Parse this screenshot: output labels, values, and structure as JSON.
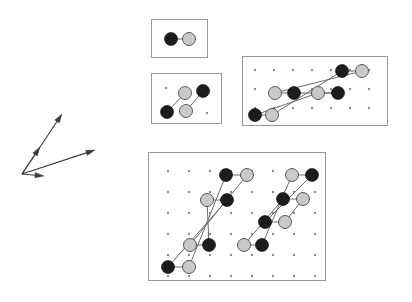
{
  "figure": {
    "background_color": "#ffffff",
    "width": 412,
    "height": 302
  },
  "colors": {
    "site_dark": "#1c1c1c",
    "site_light": "#c9c9c9",
    "site_light_stroke": "#4a4a4a",
    "bond": "#6a6a6a",
    "lattice_dot": "#8d8d8d",
    "panel_border": "#9a9a9a",
    "vector": "#3a3a3a"
  },
  "basis_vectors": {
    "name": "basis-vector-set",
    "origin": [
      22,
      174
    ],
    "vectors": [
      {
        "name": "vector-long-up",
        "label": "",
        "tip": [
          62,
          114
        ],
        "length_px": 72,
        "angle_deg": 56
      },
      {
        "name": "vector-short-up",
        "label": "",
        "tip": [
          40,
          147
        ],
        "length_px": 32,
        "angle_deg": 56
      },
      {
        "name": "vector-long-right",
        "label": "",
        "tip": [
          95,
          150
        ],
        "length_px": 76,
        "angle_deg": 18
      },
      {
        "name": "vector-short-left",
        "label": "",
        "tip": [
          44,
          176
        ],
        "length_px": 22,
        "angle_deg": -5
      }
    ]
  },
  "panels": [
    {
      "name": "panel-single-dimer",
      "index": 1,
      "rect": [
        151,
        19,
        56,
        38
      ],
      "lattice": {
        "dots": [],
        "spacing": 0
      },
      "dimers": [
        {
          "name": "dimer",
          "dark": [
            171,
            39
          ],
          "light": [
            189,
            39
          ]
        }
      ]
    },
    {
      "name": "panel-two-dimers",
      "index": 2,
      "rect": [
        151,
        73,
        70,
        50
      ],
      "lattice": {
        "spacing": 0,
        "dots": [
          [
            166,
            88
          ],
          [
            207,
            113
          ]
        ]
      },
      "dimers": [
        {
          "name": "dimer",
          "dark": [
            167,
            112
          ],
          "light": [
            185,
            93
          ]
        },
        {
          "name": "dimer",
          "dark": [
            203,
            91
          ],
          "light": [
            186,
            111
          ]
        }
      ]
    },
    {
      "name": "panel-medium-lattice",
      "index": 3,
      "rect": [
        242,
        56,
        145,
        69
      ],
      "lattice": {
        "spacing": 19,
        "cols": 7,
        "rows": 3,
        "origin": [
          255,
          70
        ]
      },
      "dimers": [
        {
          "name": "dimer",
          "dark": [
            255,
            115
          ],
          "light": [
            272,
            115
          ]
        },
        {
          "name": "dimer",
          "dark": [
            294,
            93
          ],
          "light": [
            275,
            93
          ]
        },
        {
          "name": "dimer",
          "dark": [
            342,
            71
          ],
          "light": [
            362,
            71
          ]
        },
        {
          "name": "dimer",
          "dark": [
            338,
            93
          ],
          "light": [
            318,
            93
          ]
        }
      ],
      "bonds": [
        {
          "name": "bond-long",
          "from": [
            272,
            115
          ],
          "to": [
            342,
            71
          ]
        },
        {
          "name": "bond-long",
          "from": [
            275,
            93
          ],
          "to": [
            362,
            71
          ]
        },
        {
          "name": "bond-long",
          "from": [
            255,
            115
          ],
          "to": [
            318,
            93
          ]
        },
        {
          "name": "bond-long",
          "from": [
            294,
            93
          ],
          "to": [
            338,
            93
          ]
        }
      ]
    },
    {
      "name": "panel-large-lattice",
      "index": 4,
      "rect": [
        148,
        152,
        177,
        128
      ],
      "lattice": {
        "spacing": 21,
        "cols": 8,
        "rows": 6,
        "origin": [
          168,
          171
        ]
      },
      "dimers": [
        {
          "name": "dimer",
          "dark": [
            168,
            267
          ],
          "light": [
            189,
            267
          ]
        },
        {
          "name": "dimer",
          "dark": [
            209,
            245
          ],
          "light": [
            190,
            245
          ]
        },
        {
          "name": "dimer",
          "dark": [
            227,
            200
          ],
          "light": [
            207,
            200
          ]
        },
        {
          "name": "dimer",
          "dark": [
            226,
            175
          ],
          "light": [
            247,
            175
          ]
        },
        {
          "name": "dimer",
          "dark": [
            262,
            245
          ],
          "light": [
            244,
            245
          ]
        },
        {
          "name": "dimer",
          "dark": [
            265,
            222
          ],
          "light": [
            285,
            222
          ]
        },
        {
          "name": "dimer",
          "dark": [
            283,
            199
          ],
          "light": [
            303,
            199
          ]
        },
        {
          "name": "dimer",
          "dark": [
            312,
            175
          ],
          "light": [
            292,
            175
          ]
        }
      ],
      "bonds": [
        {
          "name": "bond-long",
          "from": [
            168,
            267
          ],
          "to": [
            227,
            200
          ]
        },
        {
          "name": "bond-long",
          "from": [
            189,
            267
          ],
          "to": [
            226,
            175
          ]
        },
        {
          "name": "bond-long",
          "from": [
            190,
            245
          ],
          "to": [
            247,
            175
          ]
        },
        {
          "name": "bond-long",
          "from": [
            209,
            245
          ],
          "to": [
            207,
            200
          ]
        },
        {
          "name": "bond-long",
          "from": [
            244,
            245
          ],
          "to": [
            283,
            199
          ]
        },
        {
          "name": "bond-long",
          "from": [
            262,
            245
          ],
          "to": [
            292,
            175
          ]
        },
        {
          "name": "bond-long",
          "from": [
            265,
            222
          ],
          "to": [
            312,
            175
          ]
        },
        {
          "name": "bond-long",
          "from": [
            285,
            222
          ],
          "to": [
            303,
            199
          ]
        }
      ]
    }
  ],
  "site_radius": {
    "dark": 6.5,
    "light": 6.5,
    "dot": 1.2
  }
}
